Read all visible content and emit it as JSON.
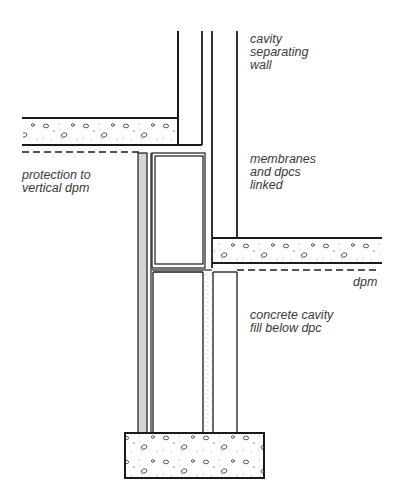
{
  "diagram": {
    "labels": {
      "cavity_wall": "cavity\nseparating\nwall",
      "membranes": "membranes\nand dpcs\nlinked",
      "protection": "protection to\nvertical dpm",
      "dpm": "dpm",
      "concrete_fill": "concrete cavity\nfill below dpc"
    },
    "elements": [
      "upper floor slab (concrete)",
      "lower floor slab (concrete)",
      "dashed dpm under upper slab",
      "dashed dpm under lower slab",
      "cavity separating wall leaves",
      "linked membranes and dpcs",
      "vertical dpm protection board",
      "concrete cavity fill below dpc",
      "strip foundation footing"
    ],
    "colors": {
      "line": "#1a1a1a",
      "protection_fill": "#d4d4d4",
      "text": "#3a3a3a"
    }
  }
}
